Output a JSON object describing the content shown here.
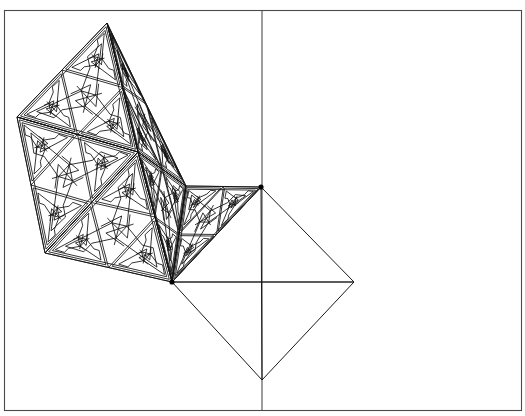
{
  "document": {
    "title": "Geometric Fractal Tiling",
    "background_color": "#ffffff",
    "width": 525,
    "height": 416
  },
  "canvas": {
    "frame": {
      "x": 4.5,
      "y": 10.5,
      "width": 517,
      "height": 400,
      "stroke_color": "#4a4a4a",
      "fill_color": "#ffffff"
    },
    "construction_axes": {
      "stroke_color": "#3a3a3a",
      "vertical": {
        "x": 262,
        "y1": 11,
        "y2": 410
      },
      "horizontal": {
        "y": 282,
        "x1": 172,
        "x2": 354
      }
    }
  },
  "chart_data": {
    "type": "line",
    "xlabel": "",
    "ylabel": "",
    "xlim": [
      0,
      525
    ],
    "ylim": [
      416,
      0
    ],
    "grid": false,
    "legend": "none",
    "key_vertices": [
      {
        "name": "apex-top",
        "x": 107,
        "y": 23
      },
      {
        "name": "left-mid",
        "x": 17,
        "y": 117
      },
      {
        "name": "hub-center",
        "x": 138,
        "y": 152
      },
      {
        "name": "left-lower",
        "x": 45,
        "y": 253
      },
      {
        "name": "junction-upper-right",
        "x": 261,
        "y": 187
      },
      {
        "name": "junction-lower-left",
        "x": 172,
        "y": 282
      },
      {
        "name": "diamond-right",
        "x": 354,
        "y": 282
      },
      {
        "name": "diamond-bottom",
        "x": 262,
        "y": 380
      }
    ],
    "plain_quadrilateral": {
      "label": "diamond",
      "points": [
        [
          261,
          187
        ],
        [
          354,
          282
        ],
        [
          262,
          380
        ],
        [
          172,
          282
        ]
      ],
      "diagonals": [
        [
          [
            261,
            187
          ],
          [
            262,
            380
          ]
        ],
        [
          [
            172,
            282
          ],
          [
            354,
            282
          ]
        ]
      ]
    },
    "fractal": {
      "motif": "pinwheel-triskelion",
      "recursion_depth": 3,
      "stroke_color": "#111111",
      "base_triangles": [
        {
          "id": "T1",
          "points": [
            [
              107,
              23
            ],
            [
              17,
              117
            ],
            [
              138,
              152
            ]
          ]
        },
        {
          "id": "T2",
          "points": [
            [
              107,
              23
            ],
            [
              138,
              152
            ],
            [
              186,
              186
            ]
          ]
        },
        {
          "id": "T3",
          "points": [
            [
              17,
              117
            ],
            [
              45,
              253
            ],
            [
              138,
              152
            ]
          ]
        },
        {
          "id": "T4",
          "points": [
            [
              45,
              253
            ],
            [
              172,
              282
            ],
            [
              138,
              152
            ]
          ]
        },
        {
          "id": "T5",
          "points": [
            [
              138,
              152
            ],
            [
              172,
              282
            ],
            [
              186,
              186
            ]
          ]
        },
        {
          "id": "T6",
          "points": [
            [
              186,
              186
            ],
            [
              172,
              282
            ],
            [
              261,
              187
            ]
          ]
        }
      ]
    }
  },
  "vertex_markers": {
    "radius": 2.6,
    "color": "#000000",
    "points": [
      {
        "x": 261,
        "y": 187
      },
      {
        "x": 172,
        "y": 282
      }
    ]
  }
}
